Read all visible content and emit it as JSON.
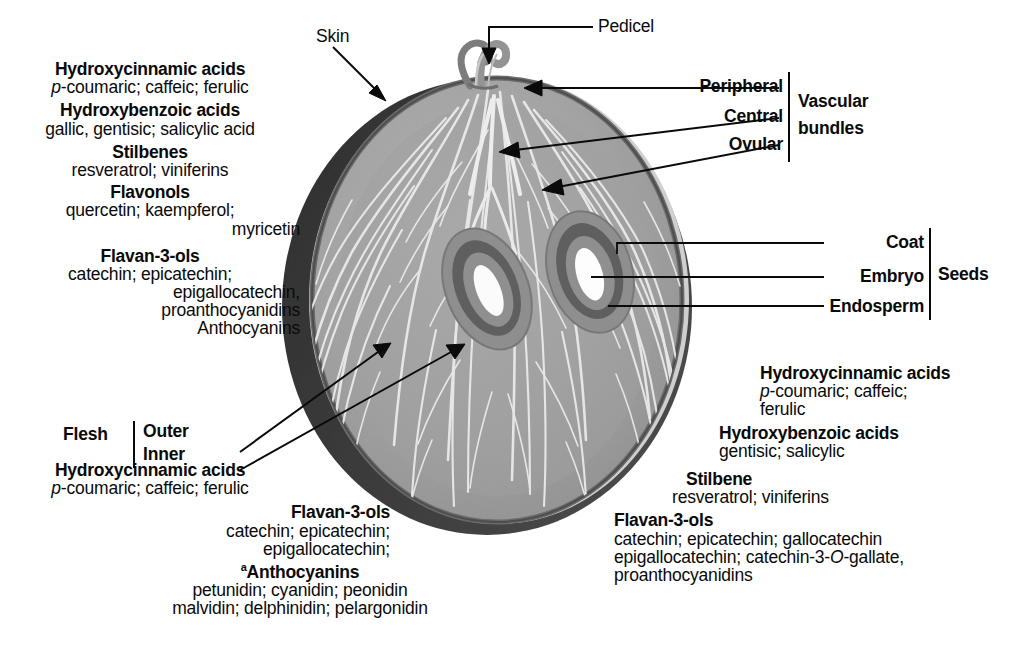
{
  "figure": {
    "footnote_marker": "a"
  },
  "callouts": {
    "skin": "Skin",
    "pedicel": "Pedicel",
    "peripheral": "Peripheral",
    "central": "Central",
    "ovular": "Ovular",
    "vascular_bundles_l1": "Vascular",
    "vascular_bundles_l2": "bundles",
    "coat": "Coat",
    "embryo": "Embryo",
    "endosperm": "Endosperm",
    "seeds": "Seeds",
    "flesh": "Flesh",
    "outer": "Outer",
    "inner": "Inner"
  },
  "skin_compounds": {
    "g1_title": "Hydroxycinnamic acids",
    "g1_l1_a": "p",
    "g1_l1_b": "-coumaric; caffeic; ferulic",
    "g2_title": "Hydroxybenzoic acids",
    "g2_l1": "gallic, gentisic; salicylic acid",
    "g3_title": "Stilbenes",
    "g3_l1": "resveratrol; viniferins",
    "g4_title": "Flavonols",
    "g4_l1": "quercetin; kaempferol;",
    "g4_l2": "myricetin",
    "g5_title": "Flavan-3-ols",
    "g5_l1": "catechin; epicatechin;",
    "g5_l2": "epigallocatechin,",
    "g5_l3": "proanthocyanidins",
    "g5_l4": "Anthocyanins"
  },
  "flesh_compounds": {
    "g1_title": "Hydroxycinnamic acids",
    "g1_l1_a": "p",
    "g1_l1_b": "-coumaric; caffeic; ferulic",
    "g2_title": "Flavan-3-ols",
    "g2_l1": "catechin; epicatechin;",
    "g2_l2": "epigallocatechin;",
    "g3_title": "Anthocyanins",
    "g3_l1": "petunidin; cyanidin; peonidin",
    "g3_l2": "malvidin; delphinidin; pelargonidin"
  },
  "seed_compounds": {
    "g1_title": "Hydroxycinnamic acids",
    "g1_l1_a": "p",
    "g1_l1_b": "-coumaric; caffeic;",
    "g1_l2": "ferulic",
    "g2_title": "Hydroxybenzoic acids",
    "g2_l1": "gentisic; salicylic",
    "g3_title": "Stilbene",
    "g3_l1": "resveratrol; viniferins",
    "g4_title": "Flavan-3-ols",
    "g4_l1": "catechin; epicatechin; gallocatechin",
    "g4_l2_a": "epigallocatechin; catechin-3-",
    "g4_l2_b": "O",
    "g4_l2_c": "-gallate,",
    "g4_l3": "proanthocyanidins"
  },
  "colors": {
    "ink": "#0a0a0a",
    "skin_dark": "#3a3a3a",
    "skin_rim": "#555555",
    "flesh_outer": "#a8a8a8",
    "flesh_inner": "#9a9a9a",
    "vein": "#e8e8e8",
    "seed_coat": "#8a8a8a",
    "seed_ring": "#6e6e6e",
    "seed_inner": "#9b9b9b",
    "embryo": "#fdfdfd",
    "pedicel": "#8f8f8f",
    "background": "#ffffff"
  }
}
